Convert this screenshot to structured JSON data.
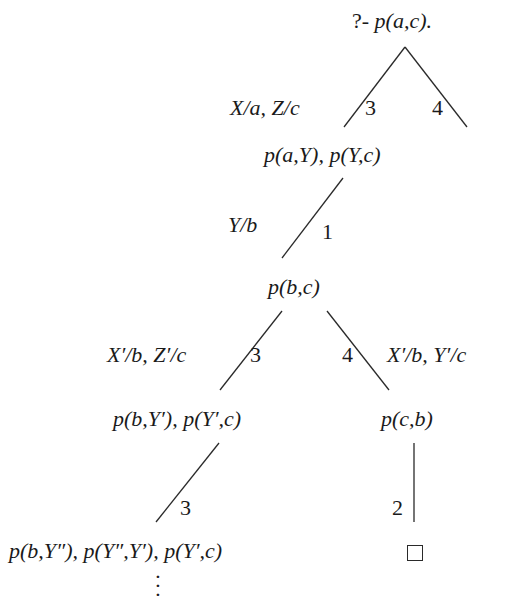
{
  "diagram": {
    "type": "sld-resolution-tree",
    "root": {
      "prefix": "?- ",
      "goal": "p(a,c).",
      "label": "?- p(a,c)."
    },
    "nodes": {
      "n1": "p(a,Y), p(Y,c)",
      "n2": "p(b,c)",
      "n3_left": "p(b,Y′), p(Y′,c)",
      "n3_right": "p(c,b)",
      "n4_left": "p(b,Y″), p(Y″,Y′), p(Y′,c)",
      "n4_right": "□",
      "continuation": "⋮"
    },
    "edges": [
      {
        "from": "root",
        "to": "n1",
        "clause": "3",
        "substitution": "X/a, Z/c"
      },
      {
        "from": "root",
        "to": "(unexpanded)",
        "clause": "4",
        "substitution": ""
      },
      {
        "from": "n1",
        "to": "n2",
        "clause": "1",
        "substitution": "Y/b"
      },
      {
        "from": "n2",
        "to": "n3_left",
        "clause": "3",
        "substitution": "X′/b, Z′/c"
      },
      {
        "from": "n2",
        "to": "n3_right",
        "clause": "4",
        "substitution": "X′/b, Y′/c"
      },
      {
        "from": "n3_left",
        "to": "n4_left",
        "clause": "3",
        "substitution": ""
      },
      {
        "from": "n3_right",
        "to": "n4_right",
        "clause": "2",
        "substitution": ""
      }
    ],
    "edge_labels": {
      "e0_sub": "X/a, Z/c",
      "e0_num": "3",
      "e1_num": "4",
      "e2_sub": "Y/b",
      "e2_num": "1",
      "e3_sub": "X′/b, Z′/c",
      "e3_num": "3",
      "e4_num": "4",
      "e4_sub": "X′/b, Y′/c",
      "e5_num": "3",
      "e6_num": "2"
    },
    "colors": {
      "line": "#2a2a2a",
      "text": "#1a1a1a",
      "background": "#ffffff"
    }
  }
}
